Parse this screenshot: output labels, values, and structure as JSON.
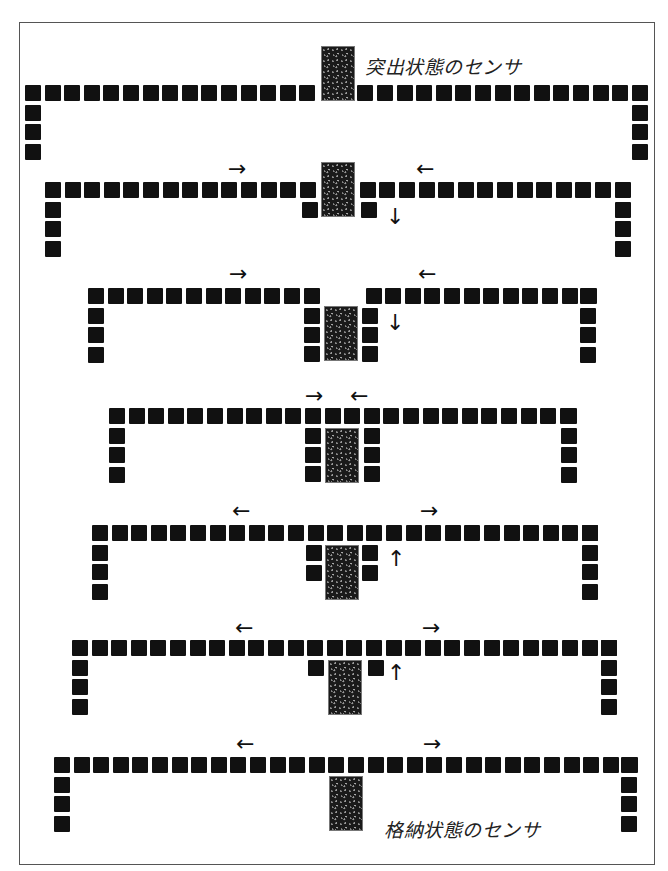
{
  "labels": {
    "protruding_sensor": "突出状態のセンサ",
    "retracted_sensor": "格納状態のセンサ"
  },
  "colors": {
    "block": "#111111",
    "sensor": "#1a1a1a",
    "frame": "#555555"
  },
  "block": {
    "size": 16,
    "pitch": 19.6
  },
  "stages": [
    {
      "name": "stage-1-protruding",
      "top_y": 85,
      "left_x": 25,
      "left_count": 15,
      "right_count": 14,
      "gap_after_left": 38,
      "leg_count": 3,
      "right_leg_x": 632,
      "sensor": {
        "x": 321,
        "y": 46
      },
      "side_blocks": [],
      "arrows": [],
      "label": {
        "key": "protruding_sensor",
        "x": 365,
        "y": 52
      }
    },
    {
      "name": "stage-2",
      "top_y": 182,
      "left_x": 45,
      "left_count": 14,
      "right_count": 13,
      "gap_after_left": 40,
      "leg_count": 3,
      "right_leg_x": 615,
      "sensor": {
        "x": 321,
        "y": 162
      },
      "side_blocks": [
        {
          "x": 302,
          "y": 202
        },
        {
          "x": 361,
          "y": 202
        }
      ],
      "arrows": [
        {
          "glyph": "→",
          "x": 228,
          "y": 158
        },
        {
          "glyph": "←",
          "x": 416,
          "y": 158
        },
        {
          "glyph": "↓",
          "x": 386,
          "y": 206
        }
      ]
    },
    {
      "name": "stage-3",
      "top_y": 288,
      "left_x": 88,
      "left_count": 12,
      "right_count": 12,
      "gap_after_left": 42,
      "leg_count": 3,
      "right_leg_x": 580,
      "sensor": {
        "x": 324,
        "y": 306
      },
      "side_blocks": [
        {
          "x": 304,
          "y": 308
        },
        {
          "x": 304,
          "y": 327
        },
        {
          "x": 304,
          "y": 346
        },
        {
          "x": 362,
          "y": 308
        },
        {
          "x": 362,
          "y": 327
        },
        {
          "x": 362,
          "y": 346
        }
      ],
      "arrows": [
        {
          "glyph": "→",
          "x": 229,
          "y": 263
        },
        {
          "glyph": "←",
          "x": 418,
          "y": 263
        },
        {
          "glyph": "↓",
          "x": 386,
          "y": 312
        }
      ]
    },
    {
      "name": "stage-4",
      "top_y": 408,
      "left_x": 109,
      "left_count": 24,
      "right_count": 0,
      "gap_after_left": 0,
      "leg_count": 3,
      "right_leg_x": 561,
      "sensor": {
        "x": 325,
        "y": 428
      },
      "side_blocks": [
        {
          "x": 305,
          "y": 428
        },
        {
          "x": 305,
          "y": 447
        },
        {
          "x": 305,
          "y": 466
        },
        {
          "x": 364,
          "y": 428
        },
        {
          "x": 364,
          "y": 447
        },
        {
          "x": 364,
          "y": 466
        }
      ],
      "arrows": [
        {
          "glyph": "→",
          "x": 305,
          "y": 385
        },
        {
          "glyph": "←",
          "x": 350,
          "y": 385
        }
      ]
    },
    {
      "name": "stage-5",
      "top_y": 525,
      "left_x": 92,
      "left_count": 26,
      "right_count": 0,
      "gap_after_left": 0,
      "leg_count": 3,
      "right_leg_x": 582,
      "sensor": {
        "x": 325,
        "y": 545
      },
      "side_blocks": [
        {
          "x": 306,
          "y": 545
        },
        {
          "x": 306,
          "y": 565
        },
        {
          "x": 362,
          "y": 545
        },
        {
          "x": 362,
          "y": 565
        }
      ],
      "arrows": [
        {
          "glyph": "←",
          "x": 232,
          "y": 500
        },
        {
          "glyph": "→",
          "x": 420,
          "y": 500
        },
        {
          "glyph": "↑",
          "x": 387,
          "y": 548
        }
      ]
    },
    {
      "name": "stage-6",
      "top_y": 640,
      "left_x": 72,
      "left_count": 28,
      "right_count": 0,
      "gap_after_left": 0,
      "leg_count": 3,
      "right_leg_x": 601,
      "sensor": {
        "x": 328,
        "y": 660
      },
      "side_blocks": [
        {
          "x": 308,
          "y": 660
        },
        {
          "x": 368,
          "y": 660
        }
      ],
      "arrows": [
        {
          "glyph": "←",
          "x": 235,
          "y": 617
        },
        {
          "glyph": "→",
          "x": 422,
          "y": 617
        },
        {
          "glyph": "↑",
          "x": 387,
          "y": 662
        }
      ]
    },
    {
      "name": "stage-7-retracted",
      "top_y": 757,
      "left_x": 54,
      "left_count": 30,
      "right_count": 0,
      "gap_after_left": 0,
      "leg_count": 3,
      "right_leg_x": 621,
      "sensor": {
        "x": 329,
        "y": 776
      },
      "side_blocks": [],
      "arrows": [
        {
          "glyph": "←",
          "x": 236,
          "y": 733
        },
        {
          "glyph": "→",
          "x": 423,
          "y": 733
        }
      ],
      "label": {
        "key": "retracted_sensor",
        "x": 384,
        "y": 815
      }
    }
  ]
}
